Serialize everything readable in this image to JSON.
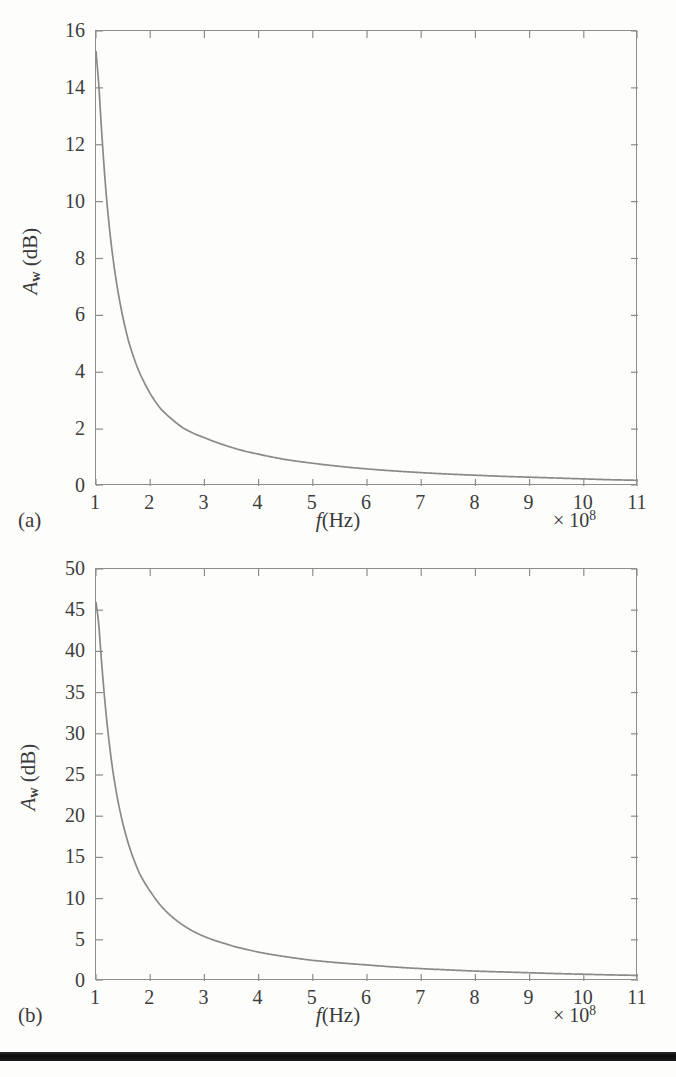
{
  "figure": {
    "panels": [
      {
        "letter": "(a)",
        "xlabel_italic": "f",
        "xlabel_rest": "(Hz)",
        "ylabel_main": "A",
        "ylabel_sub": "w",
        "ylabel_rest": " (dB)",
        "exponent_prefix": "× 10",
        "exponent_power": "8",
        "xticks": [
          "1",
          "2",
          "3",
          "4",
          "5",
          "6",
          "7",
          "8",
          "9",
          "10",
          "11"
        ],
        "yticks": [
          "0",
          "2",
          "4",
          "6",
          "8",
          "10",
          "12",
          "14",
          "16"
        ]
      },
      {
        "letter": "(b)",
        "xlabel_italic": "f",
        "xlabel_rest": "(Hz)",
        "ylabel_main": "A",
        "ylabel_sub": "w",
        "ylabel_rest": " (dB)",
        "exponent_prefix": "× 10",
        "exponent_power": "8",
        "xticks": [
          "1",
          "2",
          "3",
          "4",
          "5",
          "6",
          "7",
          "8",
          "9",
          "10",
          "11"
        ],
        "yticks": [
          "0",
          "5",
          "10",
          "15",
          "20",
          "25",
          "30",
          "35",
          "40",
          "45",
          "50"
        ]
      }
    ],
    "colors": {
      "curve": "#8a8a8a",
      "axis": "#8d8d8d",
      "text": "#3a3a3a",
      "background": "#fdfdfc",
      "bottom_bar": "#111111"
    }
  },
  "chart_data": [
    {
      "type": "line",
      "panel": "(a)",
      "title": "",
      "xlabel": "f (Hz)",
      "ylabel": "A_w (dB)",
      "x_exponent": "×10^8",
      "xlim": [
        1,
        11
      ],
      "ylim": [
        0,
        16
      ],
      "xticks": [
        1,
        2,
        3,
        4,
        5,
        6,
        7,
        8,
        9,
        10,
        11
      ],
      "yticks": [
        0,
        2,
        4,
        6,
        8,
        10,
        12,
        14,
        16
      ],
      "grid": false,
      "legend": "none",
      "series": [
        {
          "name": "A_w",
          "x": [
            1.0,
            1.05,
            1.1,
            1.2,
            1.3,
            1.4,
            1.5,
            1.6,
            1.7,
            1.8,
            1.9,
            2.0,
            2.2,
            2.4,
            2.6,
            2.8,
            3.0,
            3.2,
            3.4,
            3.6,
            3.8,
            4.0,
            4.5,
            5.0,
            5.5,
            6.0,
            6.5,
            7.0,
            7.5,
            8.0,
            8.5,
            9.0,
            9.5,
            10.0,
            10.5,
            11.0
          ],
          "values": [
            15.3,
            14.2,
            12.6,
            10.0,
            8.2,
            6.9,
            5.9,
            5.1,
            4.5,
            4.0,
            3.6,
            3.25,
            2.7,
            2.35,
            2.05,
            1.85,
            1.7,
            1.55,
            1.42,
            1.3,
            1.2,
            1.12,
            0.93,
            0.8,
            0.69,
            0.6,
            0.53,
            0.47,
            0.42,
            0.38,
            0.34,
            0.31,
            0.28,
            0.25,
            0.22,
            0.2
          ]
        }
      ]
    },
    {
      "type": "line",
      "panel": "(b)",
      "title": "",
      "xlabel": "f (Hz)",
      "ylabel": "A_w (dB)",
      "x_exponent": "×10^8",
      "xlim": [
        1,
        11
      ],
      "ylim": [
        0,
        50
      ],
      "xticks": [
        1,
        2,
        3,
        4,
        5,
        6,
        7,
        8,
        9,
        10,
        11
      ],
      "yticks": [
        0,
        5,
        10,
        15,
        20,
        25,
        30,
        35,
        40,
        45,
        50
      ],
      "grid": false,
      "legend": "none",
      "series": [
        {
          "name": "A_w",
          "x": [
            1.0,
            1.05,
            1.1,
            1.2,
            1.3,
            1.4,
            1.5,
            1.6,
            1.7,
            1.8,
            1.9,
            2.0,
            2.2,
            2.4,
            2.6,
            2.8,
            3.0,
            3.2,
            3.4,
            3.6,
            3.8,
            4.0,
            4.5,
            5.0,
            5.5,
            6.0,
            6.5,
            7.0,
            7.5,
            8.0,
            8.5,
            9.0,
            9.5,
            10.0,
            10.5,
            11.0
          ],
          "values": [
            46.0,
            43.5,
            39.0,
            31.5,
            26.0,
            22.0,
            19.0,
            16.6,
            14.7,
            13.1,
            11.9,
            10.9,
            9.1,
            7.8,
            6.8,
            6.0,
            5.4,
            4.9,
            4.5,
            4.1,
            3.8,
            3.5,
            2.95,
            2.5,
            2.2,
            1.95,
            1.7,
            1.5,
            1.35,
            1.2,
            1.1,
            1.0,
            0.9,
            0.82,
            0.74,
            0.68
          ]
        }
      ]
    }
  ]
}
